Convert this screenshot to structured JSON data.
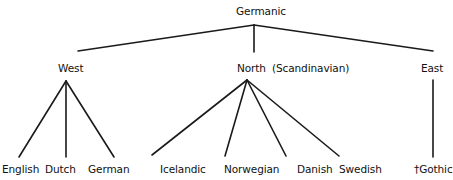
{
  "root": {
    "label": "Germanic"
  },
  "branches": [
    {
      "label": "West",
      "note": ""
    },
    {
      "label": "North",
      "note": "(Scandinavian)"
    },
    {
      "label": "East",
      "note": ""
    }
  ],
  "leaves": {
    "west": [
      "English",
      "Dutch",
      "German"
    ],
    "north": [
      "Icelandic",
      "Norwegian",
      "Danish",
      "Swedish"
    ],
    "east": [
      "†Gothic"
    ]
  },
  "edges": [
    {
      "from": "Germanic",
      "to": "West"
    },
    {
      "from": "Germanic",
      "to": "North"
    },
    {
      "from": "Germanic",
      "to": "East"
    },
    {
      "from": "West",
      "to": "English"
    },
    {
      "from": "West",
      "to": "Dutch"
    },
    {
      "from": "West",
      "to": "German"
    },
    {
      "from": "North",
      "to": "Icelandic"
    },
    {
      "from": "North",
      "to": "Norwegian"
    },
    {
      "from": "North",
      "to": "Danish"
    },
    {
      "from": "North",
      "to": "Swedish"
    },
    {
      "from": "East",
      "to": "†Gothic"
    }
  ],
  "colors": {
    "line": "#1a1a1a",
    "text": "#111111",
    "background": "#ffffff"
  }
}
